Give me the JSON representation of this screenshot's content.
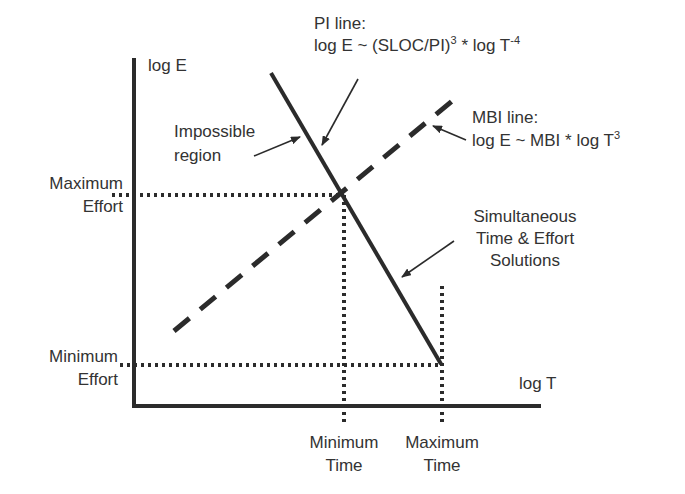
{
  "diagram": {
    "axes": {
      "y_label": "log E",
      "x_label": "log T"
    },
    "pi_line": {
      "label_line1": "PI line:",
      "formula_prefix": "log E ~ (SLOC/PI)",
      "formula_exp1": "3",
      "formula_mid": " * log T",
      "formula_exp2": "-4",
      "style": "solid"
    },
    "mbi_line": {
      "label_line1": "MBI line:",
      "formula_prefix": "log E ~ MBI * log T",
      "formula_exp": "3",
      "style": "dashed"
    },
    "annotations": {
      "impossible_region_1": "Impossible",
      "impossible_region_2": "region",
      "simultaneous_1": "Simultaneous",
      "simultaneous_2": "Time & Effort",
      "simultaneous_3": "Solutions"
    },
    "y_marks": {
      "max_effort_1": "Maximum",
      "max_effort_2": "Effort",
      "min_effort_1": "Minimum",
      "min_effort_2": "Effort"
    },
    "x_marks": {
      "min_time_1": "Minimum",
      "min_time_2": "Time",
      "max_time_1": "Maximum",
      "max_time_2": "Time"
    },
    "colors": {
      "ink": "#2b2b2b",
      "text": "#333333",
      "background": "#ffffff"
    }
  }
}
